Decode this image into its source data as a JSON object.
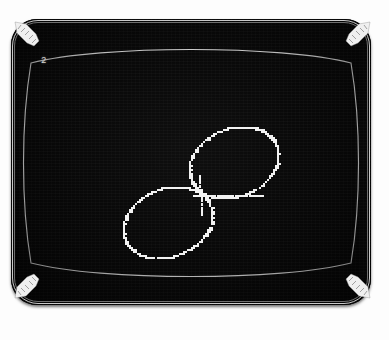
{
  "device": {
    "type": "crt-monitor",
    "casing_color": "#080808",
    "bezel_outline_color": "#c9c9c9",
    "screen_color": "#060606",
    "phosphor_color": "#f2f2f2",
    "page_background": "#fdfdfd"
  },
  "screen": {
    "status_char": "2",
    "glass_outline_color": "#e2e2e2",
    "corner_brackets": [
      {
        "name": "bracket-top-left",
        "position": "top-left"
      },
      {
        "name": "bracket-top-right",
        "position": "top-right"
      },
      {
        "name": "bracket-bottom-left",
        "position": "bottom-left"
      },
      {
        "name": "bracket-bottom-right",
        "position": "bottom-right"
      }
    ]
  },
  "chart_data": {
    "type": "scatter",
    "title": "",
    "subtitle": "",
    "xlabel": "",
    "ylabel": "",
    "grid": false,
    "legend": null,
    "xlim": [
      0,
      360
    ],
    "ylim": [
      0,
      286
    ],
    "annotations": [
      "2"
    ],
    "series": [
      {
        "name": "ellipse-upper-right",
        "shape": "ellipse",
        "center": [
          222,
          143
        ],
        "radius_x": 46,
        "radius_y": 34,
        "rotation_deg": -22,
        "dash": true,
        "color": "#f2f2f2"
      },
      {
        "name": "ellipse-lower-left",
        "shape": "ellipse",
        "center": [
          156,
          203
        ],
        "radius_x": 46,
        "radius_y": 34,
        "rotation_deg": -22,
        "dash": true,
        "color": "#f2f2f2"
      },
      {
        "name": "crossing-tick-horizontal",
        "shape": "segment",
        "from": [
          182,
          176
        ],
        "to": [
          250,
          176
        ],
        "dash": true,
        "color": "#f2f2f2"
      },
      {
        "name": "crossing-tick-vertical",
        "shape": "segment",
        "from": [
          188,
          155
        ],
        "to": [
          190,
          195
        ],
        "dash": true,
        "color": "#f2f2f2"
      }
    ]
  }
}
